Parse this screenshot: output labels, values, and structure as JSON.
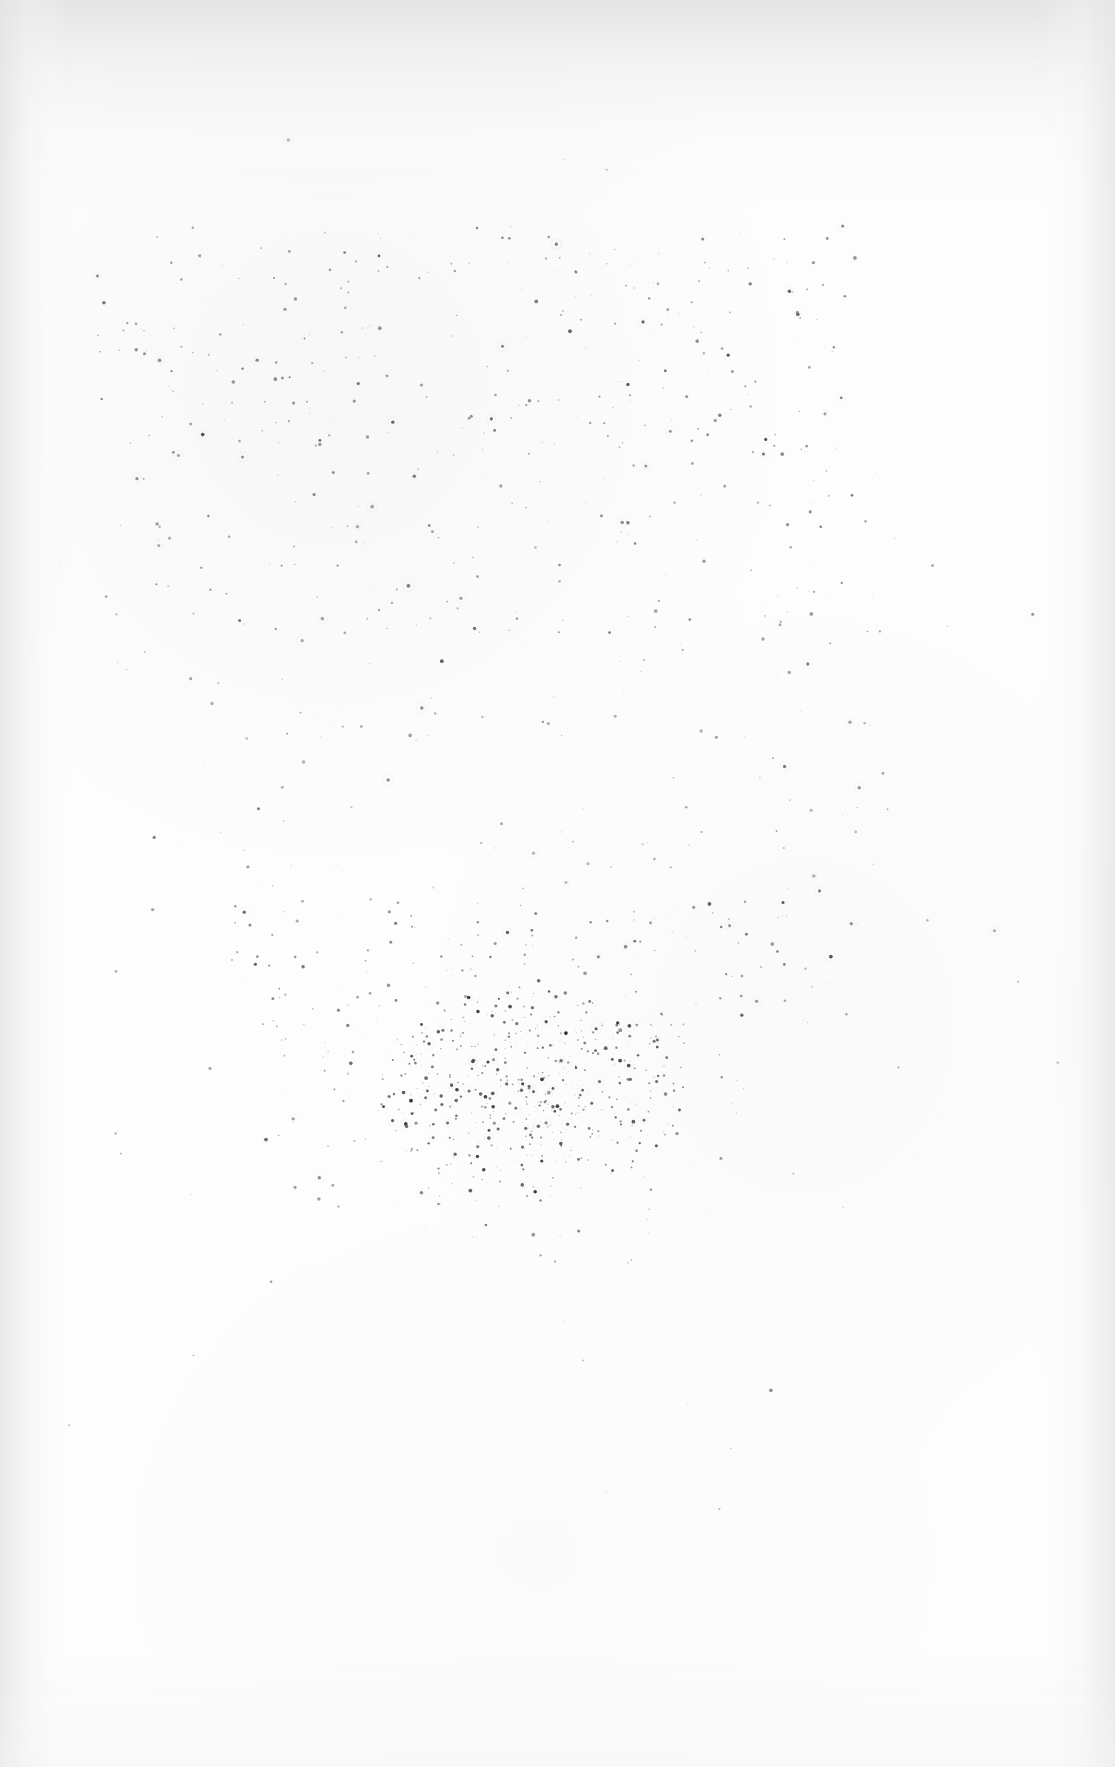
{
  "document": {
    "kind": "scanned-page",
    "page_width": 1115,
    "page_height": 1767,
    "text_content": "",
    "has_visible_text": false,
    "has_page_number": false,
    "has_header": false,
    "has_footer": false,
    "has_rules_or_borders": false,
    "description": "Blank scanned book page: off-white paper with scattered dark dust and foxing specks, densest in a cluster at lower-centre; faint grey scanner shadow along the top, left and right edges."
  },
  "colors": {
    "page_background": "#fefefe",
    "paper_base": "#fdfdfd",
    "paper_mottle": "#f7f7f7",
    "edge_shadow": "#e2e2e2",
    "speck_light": "#b4b4b4",
    "speck_mid": "#808080",
    "speck_dark": "#3c3c3c",
    "speck_darkest": "#1a1a1a"
  },
  "vignette": {
    "top_height": 210,
    "left_width": 72,
    "right_width": 78,
    "bottom_height": 120
  },
  "speckle_field": {
    "total_specks": 1420,
    "min_radius": 0.45,
    "max_radius": 1.9,
    "seed": 20250714,
    "regions": [
      {
        "name": "upper-sparse-band",
        "x": 95,
        "y": 225,
        "width": 760,
        "height": 230,
        "count": 300,
        "mean_gray": "#8a8a8a",
        "density": "medium"
      },
      {
        "name": "mid-upper-scatter",
        "x": 110,
        "y": 450,
        "width": 790,
        "height": 230,
        "count": 190,
        "mean_gray": "#9a9a9a",
        "density": "low"
      },
      {
        "name": "mid-page-thin",
        "x": 150,
        "y": 680,
        "width": 760,
        "height": 250,
        "count": 110,
        "mean_gray": "#a6a6a6",
        "density": "very-low"
      },
      {
        "name": "lower-approach",
        "x": 230,
        "y": 900,
        "width": 620,
        "height": 130,
        "count": 130,
        "mean_gray": "#8e8e8e",
        "density": "medium"
      },
      {
        "name": "dense-core-cluster",
        "cx": 530,
        "cy": 1090,
        "rx": 155,
        "ry": 105,
        "count": 430,
        "mean_gray": "#5a5a5a",
        "density": "high"
      },
      {
        "name": "cluster-halo",
        "cx": 520,
        "cy": 1105,
        "rx": 260,
        "ry": 175,
        "count": 190,
        "mean_gray": "#8c8c8c",
        "density": "low"
      },
      {
        "name": "stray-outliers",
        "x": 60,
        "y": 120,
        "width": 1000,
        "height": 1400,
        "count": 70,
        "mean_gray": "#9e9e9e",
        "density": "trace"
      }
    ]
  }
}
